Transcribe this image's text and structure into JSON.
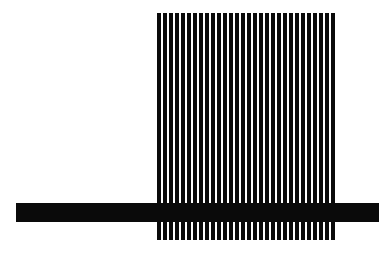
{
  "figure": {
    "name": "vertical-grating-with-horizontal-band",
    "background_color": "#ffffff",
    "canvas": {
      "width": 383,
      "height": 258
    },
    "ink_color": "#0a0a0a",
    "caption": ""
  },
  "grating": {
    "label": "vertical bar grating",
    "left": 157,
    "top": 13,
    "bottom": 240,
    "bar_count": 30,
    "bar_width": 4,
    "bar_gap": 2,
    "period": 6,
    "color": "#0a0a0a"
  },
  "band": {
    "label": "horizontal black band",
    "left": 16,
    "right": 379,
    "top": 203,
    "height": 19,
    "color": "#0a0a0a"
  },
  "chart_data": {
    "type": "bar",
    "title": "",
    "subtitle": "",
    "xlabel": "",
    "ylabel": "",
    "grid": false,
    "legend": null,
    "categories": [
      "1",
      "2",
      "3",
      "4",
      "5",
      "6",
      "7",
      "8",
      "9",
      "10",
      "11",
      "12",
      "13",
      "14",
      "15",
      "16",
      "17",
      "18",
      "19",
      "20",
      "21",
      "22",
      "23",
      "24",
      "25",
      "26",
      "27",
      "28",
      "29",
      "30"
    ],
    "values": [
      227,
      227,
      227,
      227,
      227,
      227,
      227,
      227,
      227,
      227,
      227,
      227,
      227,
      227,
      227,
      227,
      227,
      227,
      227,
      227,
      227,
      227,
      227,
      227,
      227,
      227,
      227,
      227,
      227,
      227
    ],
    "ylim": [
      0,
      258
    ],
    "xlim": [
      0,
      383
    ],
    "annotations": [
      {
        "name": "horizontal-band",
        "kind": "hspan",
        "y_start": 203,
        "y_end": 222,
        "x_start": 16,
        "x_end": 379,
        "color": "#0a0a0a"
      }
    ]
  }
}
